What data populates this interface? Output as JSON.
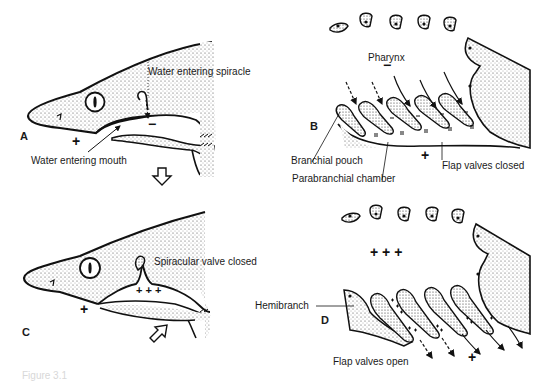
{
  "figure": {
    "caption": "Figure 3.1",
    "panels": [
      {
        "id": "A",
        "letter": "A",
        "labels": {
          "spiracle": "Water entering spiracle",
          "mouth": "Water entering mouth"
        },
        "pressure_signs": {
          "outside": "+",
          "inside": "−"
        },
        "arrow": "outflow-down"
      },
      {
        "id": "B",
        "letter": "B",
        "labels": {
          "pharynx": "Pharynx",
          "branchial_pouch": "Branchial pouch",
          "parabranchial_chamber": "Parabranchial chamber",
          "flap_valves": "Flap valves closed"
        },
        "pressure_signs": {
          "pharynx": "−",
          "outside": "+"
        }
      },
      {
        "id": "C",
        "letter": "C",
        "labels": {
          "spiracular_valve": "Spiracular valve closed"
        },
        "pressure_signs": {
          "outside": "+",
          "inside": "+ + +"
        },
        "arrow": "inflow-up"
      },
      {
        "id": "D",
        "letter": "D",
        "labels": {
          "hemibranch": "Hemibranch",
          "flap_valves": "Flap valves open"
        },
        "pressure_signs": {
          "pharynx": "+ + +",
          "outside": "+"
        }
      }
    ]
  },
  "colors": {
    "ink": "#1a1a1a",
    "stipple": "#555555",
    "background": "#ffffff"
  }
}
